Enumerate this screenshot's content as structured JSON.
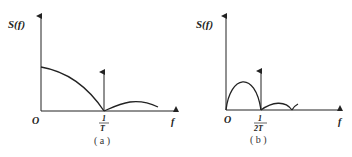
{
  "figures": [
    {
      "id": "a",
      "caption": "( a )",
      "y_label": "S(f)",
      "x_label": "f",
      "origin_label": "O",
      "tick_label_num": "1",
      "tick_label_den": "T"
    },
    {
      "id": "b",
      "caption": "( b )",
      "y_label": "S(f)",
      "x_label": "f",
      "origin_label": "O",
      "tick_label_num": "1",
      "tick_label_den": "2T"
    }
  ],
  "colors": {
    "line": "#222222",
    "background": "#ffffff"
  }
}
